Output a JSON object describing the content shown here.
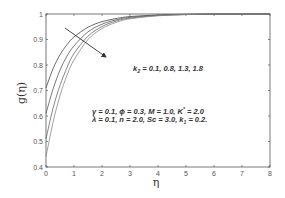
{
  "chart_data": {
    "type": "line",
    "title": "",
    "xlabel": "η",
    "ylabel": "g(η)",
    "xlim": [
      0,
      8
    ],
    "ylim": [
      0.4,
      1.0
    ],
    "xticks": [
      0,
      1,
      2,
      3,
      4,
      5,
      6,
      7,
      8
    ],
    "yticks": [
      0.4,
      0.5,
      0.6,
      0.7,
      0.8,
      0.9,
      1
    ],
    "grid": false,
    "legend": null,
    "x": [
      0,
      0.25,
      0.5,
      0.75,
      1,
      1.5,
      2,
      2.5,
      3,
      4,
      5,
      6,
      7,
      8
    ],
    "series": [
      {
        "name": "k2 = 0.1",
        "values": [
          0.71,
          0.785,
          0.84,
          0.88,
          0.91,
          0.948,
          0.97,
          0.982,
          0.99,
          0.996,
          0.999,
          1.0,
          1.0,
          1.0
        ]
      },
      {
        "name": "k2 = 0.8",
        "values": [
          0.61,
          0.705,
          0.78,
          0.835,
          0.875,
          0.93,
          0.96,
          0.977,
          0.987,
          0.995,
          0.998,
          1.0,
          1.0,
          1.0
        ]
      },
      {
        "name": "k2 = 1.3",
        "values": [
          0.51,
          0.63,
          0.72,
          0.79,
          0.845,
          0.913,
          0.951,
          0.972,
          0.984,
          0.994,
          0.998,
          1.0,
          1.0,
          1.0
        ]
      },
      {
        "name": "k2 = 1.8",
        "values": [
          0.44,
          0.575,
          0.68,
          0.76,
          0.82,
          0.9,
          0.943,
          0.967,
          0.981,
          0.993,
          0.998,
          1.0,
          1.0,
          1.0
        ]
      }
    ],
    "annotations": [
      {
        "text": "k₂ = 0.1, 0.8, 1.3, 1.8",
        "type": "arrow-label",
        "arrow_direction": "increasing k2"
      },
      {
        "text": "γ = 0.1,  ϕ = 0.3,  M = 1.0, K* = 2.0"
      },
      {
        "text": "λ = 0.1,  n = 2.0,  Sc = 3.0, k₁ = 0.2."
      }
    ]
  },
  "labels": {
    "xlabel": "η",
    "ylabel": "g(η)",
    "k2_label": "k",
    "k2_sub": "2",
    "k2_values": " = 0.1, 0.8, 1.3, 1.8",
    "params_line1_a": "γ = 0.1,  ϕ = 0.3,  M = 1.0, K",
    "params_line1_sup": "*",
    "params_line1_b": " = 2.0",
    "params_line2_a": "λ = 0.1,  n = 2.0,  Sc = 3.0, k",
    "params_line2_sub": "1",
    "params_line2_b": " = 0.2."
  },
  "colors": {
    "axis": "#555555",
    "curves": [
      "#444444",
      "#555555",
      "#666666",
      "#888888"
    ],
    "arrow": "#333333"
  }
}
